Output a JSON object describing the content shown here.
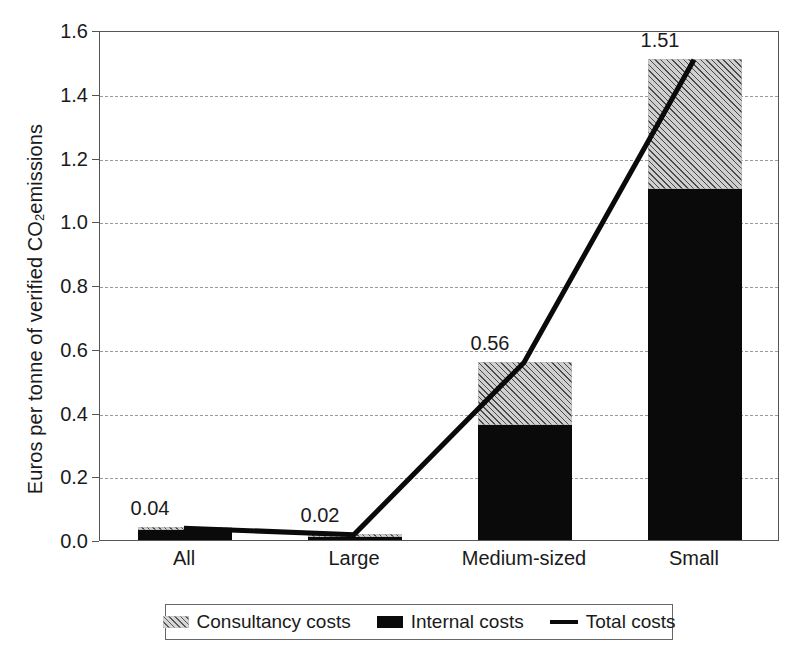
{
  "chart_data": {
    "type": "bar",
    "title": "",
    "subtitle": "",
    "xlabel": "",
    "ylabel": "Euros per tonne of verified CO2 emissions",
    "ylabel_parts": {
      "before": "Euros per tonne of verified CO",
      "sub": "2",
      "after": " emissions"
    },
    "categories": [
      "All",
      "Large",
      "Medium-sized",
      "Small"
    ],
    "series": [
      {
        "name": "Internal costs",
        "type": "bar",
        "stacked": true,
        "values": [
          0.03,
          0.01,
          0.36,
          1.1
        ]
      },
      {
        "name": "Consultancy costs",
        "type": "bar",
        "stacked": true,
        "values": [
          0.01,
          0.01,
          0.2,
          0.41
        ]
      },
      {
        "name": "Total costs",
        "type": "line",
        "values": [
          0.04,
          0.02,
          0.56,
          1.51
        ]
      }
    ],
    "data_labels": [
      "0.04",
      "0.02",
      "0.56",
      "1.51"
    ],
    "ylim": [
      0.0,
      1.6
    ],
    "ytick_values": [
      0.0,
      0.2,
      0.4,
      0.6,
      0.8,
      1.0,
      1.2,
      1.4,
      1.6
    ],
    "ytick_labels": [
      "0.0",
      "0.2",
      "0.4",
      "0.6",
      "0.8",
      "1.0",
      "1.2",
      "1.4",
      "1.6"
    ],
    "grid": true,
    "grid_style": "dashed-horizontal",
    "legend_position": "bottom",
    "legend_entries": [
      "Consultancy costs",
      "Internal costs",
      "Total costs"
    ],
    "colors": {
      "internal": "#0a0a0a",
      "consultancy_fill": "#cfcfcf",
      "consultancy_hatch": "#4a4a4a",
      "total_line": "#0a0a0a",
      "gridline": "#9a9a9a",
      "axis": "#555555",
      "background": "#ffffff",
      "text": "#1a1a1a"
    }
  },
  "legend": {
    "items": [
      {
        "label": "Consultancy costs",
        "marker": "hatched-swatch"
      },
      {
        "label": "Internal costs",
        "marker": "solid-black-swatch"
      },
      {
        "label": "Total costs",
        "marker": "line-swatch"
      }
    ]
  }
}
